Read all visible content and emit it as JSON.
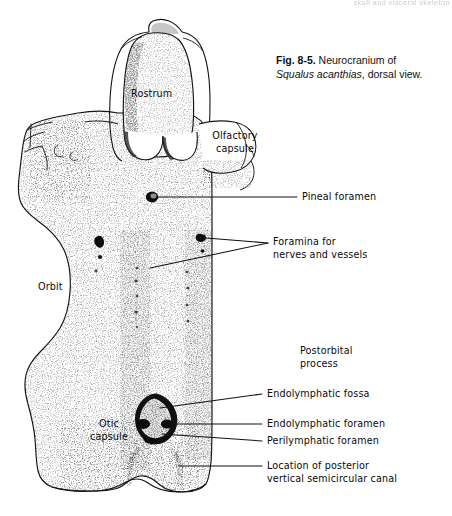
{
  "page": {
    "running_head": "skull and visceral skeleton",
    "background": "#ffffff",
    "ink": "#0a0a0a"
  },
  "caption": {
    "figure_number": "Fig. 8-5.",
    "text_line1": " Neurocranium of",
    "species": "Squalus acanthias",
    "text_line2": ", dorsal view."
  },
  "figure": {
    "title": "Neurocranium of Squalus acanthias, dorsal view",
    "view": "dorsal",
    "specimen": "Squalus acanthias",
    "labels": [
      {
        "id": "rostrum",
        "text": "Rostrum",
        "x": 131,
        "y": 88,
        "leader": false
      },
      {
        "id": "olfactory-capsule",
        "text": "Olfactory\ncapsule",
        "x": 208,
        "y": 130,
        "leader": false
      },
      {
        "id": "orbit",
        "text": "Orbit",
        "x": 38,
        "y": 281,
        "leader": false
      },
      {
        "id": "otic-capsule",
        "text": "Otic\ncapsule",
        "x": 94,
        "y": 418,
        "leader": false
      },
      {
        "id": "pineal-foramen",
        "text": "Pineal foramen",
        "x": 302,
        "y": 192,
        "leader": true
      },
      {
        "id": "foramina-nerves",
        "text": "Foramina for\nnerves and vessels",
        "x": 273,
        "y": 236,
        "leader": true
      },
      {
        "id": "postorbital-process",
        "text": "Postorbital\nprocess",
        "x": 300,
        "y": 345,
        "leader": false
      },
      {
        "id": "endolymphatic-fossa",
        "text": "Endolymphatic fossa",
        "x": 267,
        "y": 390,
        "leader": true
      },
      {
        "id": "endolymphatic-foramen",
        "text": "Endolymphatic foramen",
        "x": 267,
        "y": 420,
        "leader": true
      },
      {
        "id": "perilymphatic-foramen",
        "text": "Perilymphatic foramen",
        "x": 267,
        "y": 437,
        "leader": true
      },
      {
        "id": "posterior-canal",
        "text": "Location of posterior\nvertical semicircular canal",
        "x": 267,
        "y": 461,
        "leader": true
      }
    ]
  }
}
